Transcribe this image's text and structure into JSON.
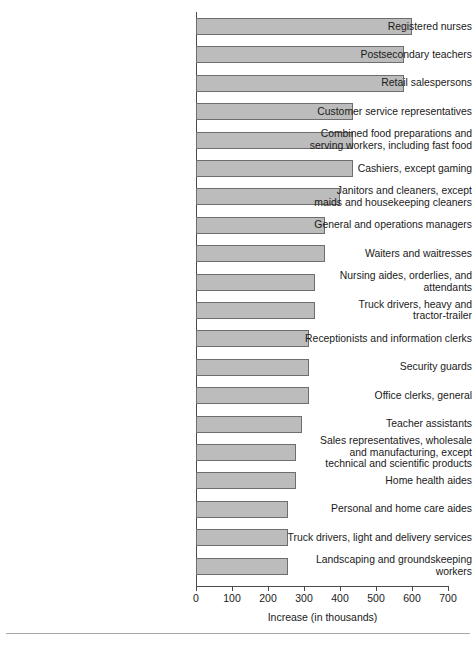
{
  "chart_data": {
    "type": "bar",
    "orientation": "horizontal",
    "title": "",
    "xlabel": "Increase (in thousands)",
    "ylabel": "",
    "xlim": [
      0,
      700
    ],
    "xticks": [
      0,
      100,
      200,
      300,
      400,
      500,
      600,
      700
    ],
    "xtick_labels": [
      "0",
      "100",
      "200",
      "300",
      "400",
      "500",
      "600",
      "700"
    ],
    "grid": false,
    "legend": false,
    "bar_fill_color": "#bcbcbc",
    "bar_edge_color": "#6e6e6e",
    "categories": [
      "Registered nurses",
      "Postsecondary teachers",
      "Retail salespersons",
      "Customer service representatives",
      "Combined food preparations and serving workers, including fast food",
      "Cashiers, except gaming",
      "Janitors and cleaners, except maids and housekeeping cleaners",
      "General and operations managers",
      "Waiters and waitresses",
      "Nursing aides, orderlies, and attendants",
      "Truck drivers, heavy and tractor-trailer",
      "Receptionists and information clerks",
      "Security guards",
      "Office clerks, general",
      "Teacher assistants",
      "Sales representatives, wholesale and manufacturing, except technical and scientific products",
      "Home health aides",
      "Personal and home care aides",
      "Truck drivers, light and delivery services",
      "Landscaping and groundskeeping workers"
    ],
    "category_lines": [
      [
        "Registered nurses"
      ],
      [
        "Postsecondary teachers"
      ],
      [
        "Retail salespersons"
      ],
      [
        "Customer service representatives"
      ],
      [
        "Combined food preparations and",
        "serving workers, including fast food"
      ],
      [
        "Cashiers, except gaming"
      ],
      [
        "Janitors and cleaners, except",
        "maids and housekeeping cleaners"
      ],
      [
        "General and operations managers"
      ],
      [
        "Waiters and waitresses"
      ],
      [
        "Nursing aides, orderlies, and",
        "attendants"
      ],
      [
        "Truck drivers, heavy and",
        "tractor-trailer"
      ],
      [
        "Receptionists and information clerks"
      ],
      [
        "Security guards"
      ],
      [
        "Office clerks, general"
      ],
      [
        "Teacher assistants"
      ],
      [
        "Sales representatives, wholesale",
        "and manufacturing, except",
        "technical and scientific products"
      ],
      [
        "Home health aides"
      ],
      [
        "Personal and home care aides"
      ],
      [
        "Truck drivers, light and delivery services"
      ],
      [
        "Landscaping and groundskeeping",
        "workers"
      ]
    ],
    "values": [
      600,
      578,
      578,
      436,
      436,
      436,
      400,
      358,
      358,
      330,
      330,
      314,
      314,
      314,
      295,
      278,
      278,
      256,
      256,
      256
    ]
  }
}
